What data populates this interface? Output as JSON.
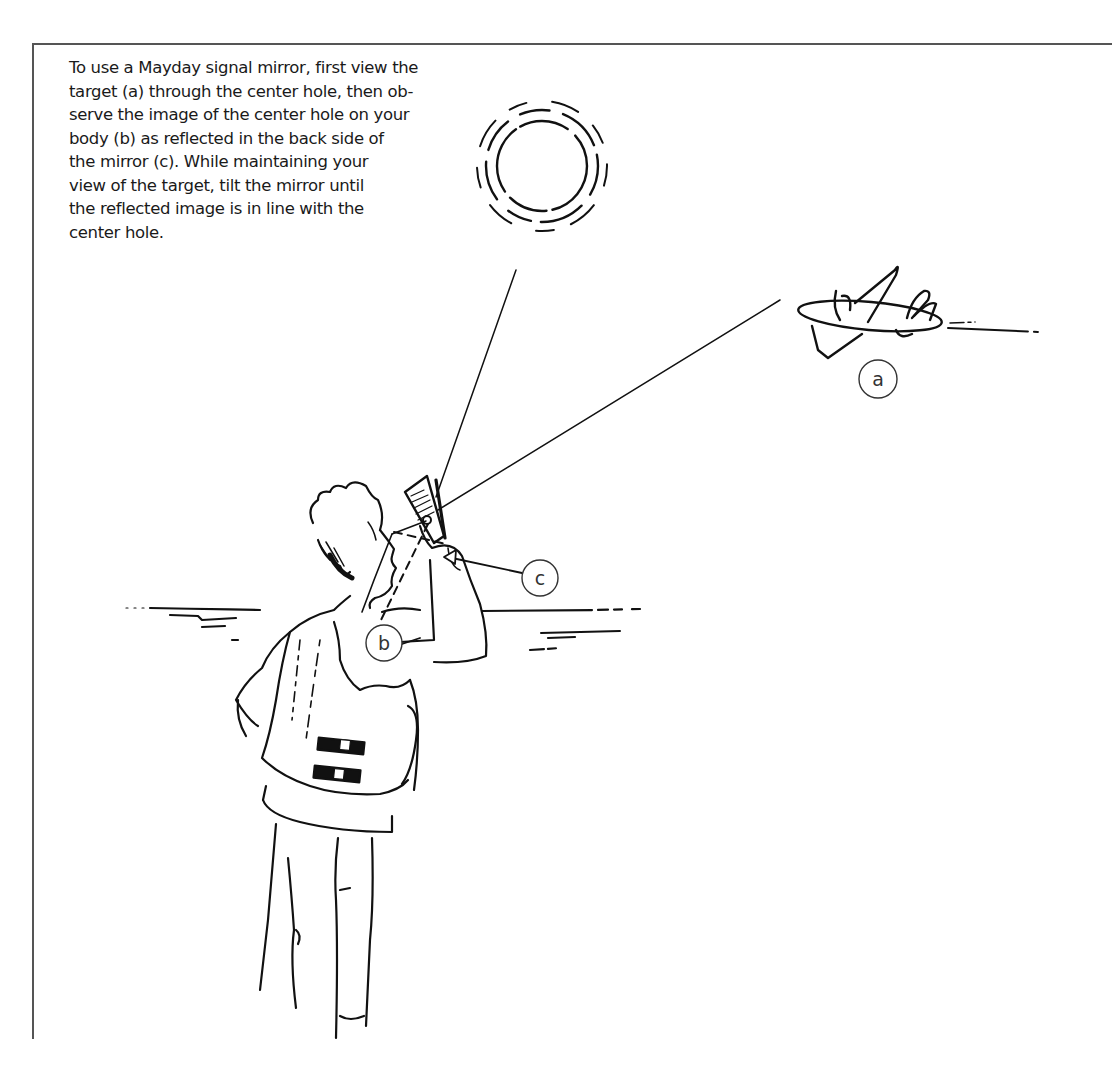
{
  "caption": {
    "lines": [
      "To use a Mayday signal mirror, first view the",
      "target (a) through the center hole, then ob-",
      "serve the image of the center hole on your",
      "body (b) as reflected in the back side of",
      "the mirror (c). While maintaining your",
      "view of the target, tilt the mirror until",
      "the reflected image is in line with the",
      "center hole."
    ]
  },
  "illustration": {
    "sun": {
      "icon": "sun-icon"
    },
    "airplane": {
      "icon": "airplane-icon"
    },
    "person": {
      "icon": "person-with-life-vest-icon"
    },
    "mirror": {
      "icon": "signal-mirror-icon"
    },
    "callouts": [
      {
        "id": "a",
        "label": "a",
        "target": "airplane"
      },
      {
        "id": "b",
        "label": "b",
        "target": "body"
      },
      {
        "id": "c",
        "label": "c",
        "target": "mirror"
      }
    ]
  }
}
